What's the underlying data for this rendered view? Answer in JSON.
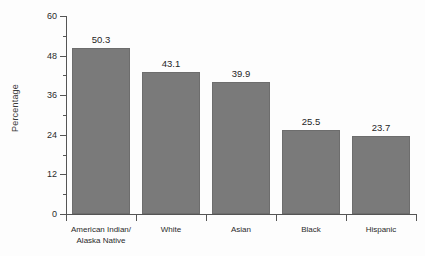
{
  "chart_data": {
    "type": "bar",
    "title": "",
    "xlabel": "",
    "ylabel": "Percentage",
    "categories": [
      "American Indian/\nAlaska Native",
      "White",
      "Asian",
      "Black",
      "Hispanic"
    ],
    "category_lines": [
      [
        "American Indian/",
        "Alaska Native"
      ],
      [
        "White"
      ],
      [
        "Asian"
      ],
      [
        "Black"
      ],
      [
        "Hispanic"
      ]
    ],
    "values": [
      50.3,
      43.1,
      39.9,
      25.5,
      23.7
    ],
    "value_labels": [
      "50.3",
      "43.1",
      "39.9",
      "25.5",
      "23.7"
    ],
    "ylim": [
      0,
      60
    ],
    "ytick_major": [
      0,
      12,
      24,
      36,
      48,
      60
    ],
    "ytick_major_labels": [
      "0",
      "12",
      "24",
      "36",
      "48",
      "60"
    ],
    "ytick_minor": [
      6,
      18,
      30,
      42,
      54
    ],
    "grid": false,
    "legend": false,
    "bar_color": "#7a7a7a",
    "axis_color": "#555555",
    "text_color": "#2b2b2b",
    "background": "#ffffff"
  }
}
